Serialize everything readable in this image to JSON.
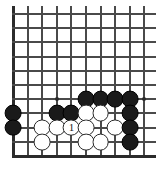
{
  "diagram": {
    "kind": "go-board-problem",
    "board": {
      "cols": 10,
      "rows": 11,
      "origin_x": 13,
      "origin_y": 14,
      "step_x": 14.6,
      "step_y": 14.2,
      "stone_radius": 8.4,
      "line_color": "#4a4a4a",
      "edge_color": "#2b2b2b",
      "background": "#ffffff",
      "cropped_edges": [
        "top",
        "right"
      ],
      "solid_edges": [
        "left",
        "bottom"
      ]
    },
    "hoshi": [
      {
        "col": 3,
        "row": 6
      },
      {
        "col": 9,
        "row": 6
      }
    ],
    "stones": [
      {
        "col": 5,
        "row": 6,
        "color": "black",
        "label": ""
      },
      {
        "col": 6,
        "row": 6,
        "color": "black",
        "label": ""
      },
      {
        "col": 7,
        "row": 6,
        "color": "black",
        "label": ""
      },
      {
        "col": 8,
        "row": 6,
        "color": "black",
        "label": ""
      },
      {
        "col": 0,
        "row": 7,
        "color": "black",
        "label": ""
      },
      {
        "col": 3,
        "row": 7,
        "color": "black",
        "label": ""
      },
      {
        "col": 4,
        "row": 7,
        "color": "black",
        "label": ""
      },
      {
        "col": 5,
        "row": 7,
        "color": "white",
        "label": ""
      },
      {
        "col": 6,
        "row": 7,
        "color": "white",
        "label": ""
      },
      {
        "col": 8,
        "row": 7,
        "color": "black",
        "label": ""
      },
      {
        "col": 0,
        "row": 8,
        "color": "black",
        "label": ""
      },
      {
        "col": 2,
        "row": 8,
        "color": "white",
        "label": ""
      },
      {
        "col": 3,
        "row": 8,
        "color": "white",
        "label": ""
      },
      {
        "col": 4,
        "row": 8,
        "color": "white",
        "label": "1"
      },
      {
        "col": 5,
        "row": 8,
        "color": "white",
        "label": ""
      },
      {
        "col": 7,
        "row": 8,
        "color": "white",
        "label": ""
      },
      {
        "col": 8,
        "row": 8,
        "color": "black",
        "label": ""
      },
      {
        "col": 2,
        "row": 9,
        "color": "white",
        "label": ""
      },
      {
        "col": 5,
        "row": 9,
        "color": "white",
        "label": ""
      },
      {
        "col": 6,
        "row": 9,
        "color": "white",
        "label": ""
      },
      {
        "col": 8,
        "row": 9,
        "color": "black",
        "label": ""
      }
    ],
    "move_marker": {
      "number": "1",
      "color": "white",
      "col": 4,
      "row": 8
    }
  }
}
